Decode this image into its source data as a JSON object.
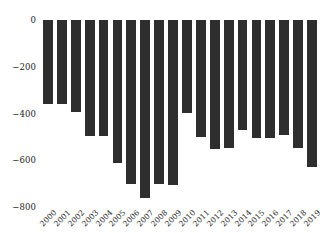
{
  "chart_data": {
    "type": "bar",
    "title": "",
    "subtitle": "",
    "xlabel": "",
    "ylabel": "",
    "categories": [
      "2000",
      "2001",
      "2002",
      "2003",
      "2004",
      "2005",
      "2006",
      "2007",
      "2008",
      "2009",
      "2010",
      "2011",
      "2012",
      "2013",
      "2014",
      "2015",
      "2016",
      "2017",
      "2018",
      "2019"
    ],
    "values": [
      -360,
      -360,
      -393,
      -496,
      -496,
      -611,
      -700,
      -762,
      -700,
      -705,
      -396,
      -500,
      -552,
      -548,
      -470,
      -505,
      -505,
      -490,
      -548,
      -630
    ],
    "series": [
      {
        "name": "value",
        "values": [
          -360,
          -360,
          -393,
          -496,
          -496,
          -611,
          -700,
          -762,
          -700,
          -705,
          -396,
          -500,
          -552,
          -548,
          -470,
          -505,
          -505,
          -490,
          -548,
          -630
        ]
      }
    ],
    "ylim": [
      -800,
      0
    ],
    "yticks": [
      0,
      -200,
      -400,
      -600,
      -800
    ],
    "ytick_labels": [
      "0",
      "−200",
      "−400",
      "−600",
      "−800"
    ],
    "xticks": [
      "2000",
      "2001",
      "2002",
      "2003",
      "2004",
      "2005",
      "2006",
      "2007",
      "2008",
      "2009",
      "2010",
      "2011",
      "2012",
      "2013",
      "2014",
      "2015",
      "2016",
      "2017",
      "2018",
      "2019"
    ],
    "grid": false,
    "legend": null,
    "bar_color": "#2e2e2e",
    "background_color": "#ffffff",
    "text_color": "#1a1a1a",
    "xtick_rotation": -45
  }
}
